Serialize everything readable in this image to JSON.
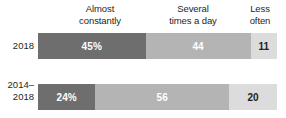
{
  "chart_data": {
    "type": "bar",
    "subtype": "stacked-horizontal-100",
    "title": "",
    "xlabel": "",
    "ylabel": "",
    "grid": false,
    "legend_position": "top",
    "units": "percent",
    "xlim": [
      0,
      100
    ],
    "categories": [
      "2018",
      "2014–2018"
    ],
    "series": [
      {
        "name": "Almost constantly",
        "values": [
          45,
          24
        ]
      },
      {
        "name": "Several times a day",
        "values": [
          44,
          56
        ]
      },
      {
        "name": "Less often",
        "values": [
          11,
          20
        ]
      }
    ],
    "data_labels": [
      [
        "45%",
        "44",
        "11"
      ],
      [
        "24%",
        "56",
        "20"
      ]
    ]
  },
  "colors": {
    "almost_constantly": "#6e6e6e",
    "several_times_a_day": "#b4b4b4",
    "less_often": "#dcdcdc",
    "text_dark": "#231f20",
    "text_light": "#ffffff",
    "background": "#ffffff"
  },
  "headers": {
    "almost_constantly": {
      "line1": "Almost",
      "line2": "constantly"
    },
    "several_times_a_day": {
      "line1": "Several",
      "line2": "times a day"
    },
    "less_often": {
      "line1": "Less",
      "line2": "often"
    }
  },
  "rows": [
    {
      "label": {
        "line1": "2018",
        "line2": ""
      },
      "segments": [
        {
          "name": "almost-constantly",
          "label": "45%",
          "value": 45
        },
        {
          "name": "several-times-a-day",
          "label": "44",
          "value": 44
        },
        {
          "name": "less-often",
          "label": "11",
          "value": 11
        }
      ]
    },
    {
      "label": {
        "line1": "2014–",
        "line2": "2018"
      },
      "segments": [
        {
          "name": "almost-constantly",
          "label": "24%",
          "value": 24
        },
        {
          "name": "several-times-a-day",
          "label": "56",
          "value": 56
        },
        {
          "name": "less-often",
          "label": "20",
          "value": 20
        }
      ]
    }
  ]
}
